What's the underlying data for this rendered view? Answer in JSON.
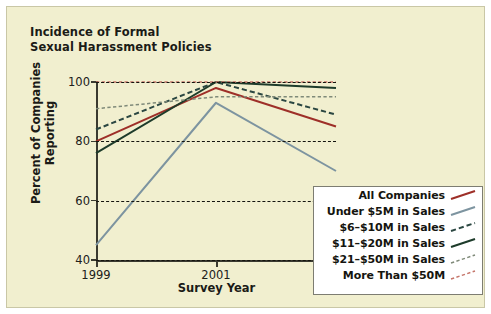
{
  "figure": {
    "title": "Incidence of Formal\nSexual Harassment Policies",
    "background_color": "#f1efcf",
    "legend_background": "#ffffff",
    "legend_border": "#7d7d72"
  },
  "chart_data": {
    "type": "line",
    "title": "Incidence of Formal Sexual Harassment Policies",
    "xlabel": "Survey Year",
    "ylabel": "Percent of Companies\nReporting",
    "categories": [
      "1999",
      "2001",
      "2003"
    ],
    "x": [
      1999,
      2001,
      2003
    ],
    "xlim": [
      1999,
      2003
    ],
    "ylim": [
      40,
      100
    ],
    "yticks": [
      40,
      60,
      80,
      100
    ],
    "xticks": [
      "1999",
      "2001",
      "2003"
    ],
    "grid": "horizontal-dashed",
    "legend_position": "lower-right",
    "series": [
      {
        "name": "All Companies",
        "values": [
          80,
          98,
          85
        ],
        "color": "#9e2f28",
        "style": "solid",
        "width": 2.0
      },
      {
        "name": "Under $5M in Sales",
        "values": [
          45,
          93,
          70
        ],
        "color": "#7d94a0",
        "style": "solid",
        "width": 2.0
      },
      {
        "name": "$6-$10M in Sales",
        "values": [
          84,
          100,
          89
        ],
        "color": "#2b4742",
        "style": "dashed",
        "width": 2.0
      },
      {
        "name": "$11-$20M in Sales",
        "values": [
          76,
          100,
          98
        ],
        "color": "#1d3b2a",
        "style": "solid",
        "width": 2.0
      },
      {
        "name": "$21-$50M in Sales",
        "values": [
          91,
          95,
          95
        ],
        "color": "#7f8a79",
        "style": "dashed-fine",
        "width": 1.5
      },
      {
        "name": "More Than $50M",
        "values": [
          100,
          100,
          100
        ],
        "color": "#c5756a",
        "style": "dashed-fine",
        "width": 1.5
      }
    ]
  },
  "axes": {
    "y_tick_labels": [
      "100",
      "80",
      "60",
      "40"
    ],
    "x_tick_labels": [
      "1999",
      "2001",
      "2003"
    ],
    "y_axis_title": "Percent of Companies\nReporting",
    "x_axis_title": "Survey Year"
  },
  "legend": {
    "entries": [
      {
        "label": "All Companies"
      },
      {
        "label": "Under $5M in Sales"
      },
      {
        "label": "$6–$10M in Sales"
      },
      {
        "label": "$11–$20M in Sales"
      },
      {
        "label": "$21–$50M in Sales"
      },
      {
        "label": "More Than $50M"
      }
    ]
  }
}
